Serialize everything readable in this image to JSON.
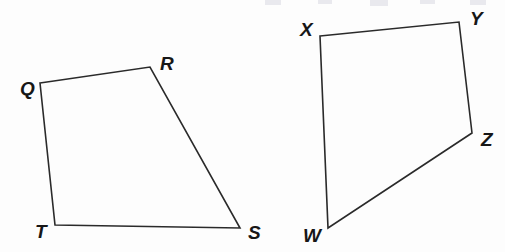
{
  "figure": {
    "background_color": "#fdfdfd",
    "stroke_color": "#2a2a2a",
    "label_color": "#171717",
    "canvas": {
      "width": 505,
      "height": 252
    }
  },
  "shapes": [
    {
      "id": "quadrilateral-qrst",
      "name": "QRST",
      "type": "quadrilateral",
      "points": "40,83 150,67 240,228 55,225",
      "vertices": [
        {
          "label": "Q",
          "x": 40,
          "y": 83,
          "label_x": 20,
          "label_y": 90
        },
        {
          "label": "R",
          "x": 150,
          "y": 67,
          "label_x": 160,
          "label_y": 65
        },
        {
          "label": "S",
          "x": 240,
          "y": 228,
          "label_x": 248,
          "label_y": 234
        },
        {
          "label": "T",
          "x": 55,
          "y": 225,
          "label_x": 35,
          "label_y": 233
        }
      ]
    },
    {
      "id": "quadrilateral-xyzw",
      "name": "XYZW",
      "type": "quadrilateral",
      "points": "320,36 459,22 472,133 328,228",
      "vertices": [
        {
          "label": "X",
          "x": 320,
          "y": 36,
          "label_x": 300,
          "label_y": 31
        },
        {
          "label": "Y",
          "x": 459,
          "y": 22,
          "label_x": 470,
          "label_y": 20
        },
        {
          "label": "Z",
          "x": 472,
          "y": 133,
          "label_x": 481,
          "label_y": 141
        },
        {
          "label": "W",
          "x": 328,
          "y": 228,
          "label_x": 303,
          "label_y": 237
        }
      ]
    }
  ],
  "scan_artifacts": [
    {
      "x": 265,
      "y": 0,
      "width": 16,
      "height": 5
    },
    {
      "x": 318,
      "y": 0,
      "width": 14,
      "height": 4
    },
    {
      "x": 370,
      "y": 0,
      "width": 18,
      "height": 6
    },
    {
      "x": 420,
      "y": 0,
      "width": 15,
      "height": 4
    },
    {
      "x": 470,
      "y": 0,
      "width": 16,
      "height": 5
    }
  ]
}
